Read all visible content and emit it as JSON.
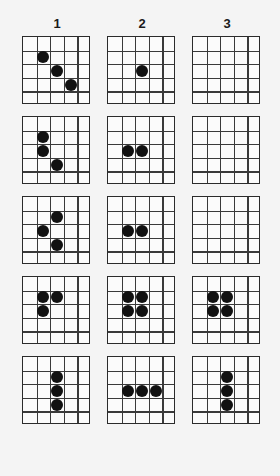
{
  "page": {
    "background_color": "#f4f4f4",
    "grid_line_color": "#3a3a3a",
    "dot_color": "#111111"
  },
  "columns": [
    {
      "label": "1"
    },
    {
      "label": "2"
    },
    {
      "label": "3"
    }
  ],
  "grid_size": {
    "rows": 5,
    "cols": 5
  },
  "chart_data": {
    "type": "heatmap",
    "xlabel": "",
    "ylabel": "",
    "categories": [
      "1",
      "2",
      "3"
    ],
    "grid_rows": 5,
    "grid_cols": 5,
    "panels": [
      {
        "row": 1,
        "column": "1",
        "dot_count": 3,
        "dots": [
          {
            "r": 2,
            "c": 2
          },
          {
            "r": 3,
            "c": 3
          },
          {
            "r": 4,
            "c": 4
          }
        ]
      },
      {
        "row": 1,
        "column": "2",
        "dot_count": 1,
        "dots": [
          {
            "r": 3,
            "c": 3
          }
        ]
      },
      {
        "row": 1,
        "column": "3",
        "dot_count": 0,
        "dots": []
      },
      {
        "row": 2,
        "column": "1",
        "dot_count": 3,
        "dots": [
          {
            "r": 2,
            "c": 2
          },
          {
            "r": 3,
            "c": 2
          },
          {
            "r": 4,
            "c": 3
          }
        ]
      },
      {
        "row": 2,
        "column": "2",
        "dot_count": 2,
        "dots": [
          {
            "r": 3,
            "c": 2
          },
          {
            "r": 3,
            "c": 3
          }
        ]
      },
      {
        "row": 2,
        "column": "3",
        "dot_count": 0,
        "dots": []
      },
      {
        "row": 3,
        "column": "1",
        "dot_count": 3,
        "dots": [
          {
            "r": 2,
            "c": 3
          },
          {
            "r": 3,
            "c": 2
          },
          {
            "r": 4,
            "c": 3
          }
        ]
      },
      {
        "row": 3,
        "column": "2",
        "dot_count": 2,
        "dots": [
          {
            "r": 3,
            "c": 2
          },
          {
            "r": 3,
            "c": 3
          }
        ]
      },
      {
        "row": 3,
        "column": "3",
        "dot_count": 0,
        "dots": []
      },
      {
        "row": 4,
        "column": "1",
        "dot_count": 3,
        "dots": [
          {
            "r": 2,
            "c": 2
          },
          {
            "r": 2,
            "c": 3
          },
          {
            "r": 3,
            "c": 2
          }
        ]
      },
      {
        "row": 4,
        "column": "2",
        "dot_count": 4,
        "dots": [
          {
            "r": 2,
            "c": 2
          },
          {
            "r": 2,
            "c": 3
          },
          {
            "r": 3,
            "c": 2
          },
          {
            "r": 3,
            "c": 3
          }
        ]
      },
      {
        "row": 4,
        "column": "3",
        "dot_count": 4,
        "dots": [
          {
            "r": 2,
            "c": 2
          },
          {
            "r": 2,
            "c": 3
          },
          {
            "r": 3,
            "c": 2
          },
          {
            "r": 3,
            "c": 3
          }
        ]
      },
      {
        "row": 5,
        "column": "1",
        "dot_count": 3,
        "dots": [
          {
            "r": 2,
            "c": 3
          },
          {
            "r": 3,
            "c": 3
          },
          {
            "r": 4,
            "c": 3
          }
        ]
      },
      {
        "row": 5,
        "column": "2",
        "dot_count": 3,
        "dots": [
          {
            "r": 3,
            "c": 2
          },
          {
            "r": 3,
            "c": 3
          },
          {
            "r": 3,
            "c": 4
          }
        ]
      },
      {
        "row": 5,
        "column": "3",
        "dot_count": 3,
        "dots": [
          {
            "r": 2,
            "c": 3
          },
          {
            "r": 3,
            "c": 3
          },
          {
            "r": 4,
            "c": 3
          }
        ]
      }
    ]
  }
}
